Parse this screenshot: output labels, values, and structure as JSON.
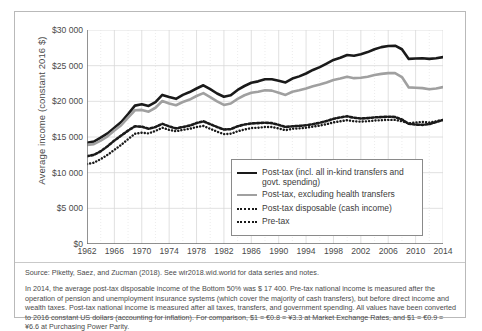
{
  "chart_data": {
    "type": "line",
    "title": "",
    "xlabel": "",
    "ylabel": "Average income (constant 2016 $)",
    "xlim": [
      1962,
      2014
    ],
    "ylim": [
      0,
      30000
    ],
    "grid": true,
    "legend_position": "inside-bottom-right",
    "ytick_labels": [
      "$30 000",
      "$25 000",
      "$20 000",
      "$15 000",
      "$10 000",
      "$5 000",
      "$0"
    ],
    "ytick_values": [
      30000,
      25000,
      20000,
      15000,
      10000,
      5000,
      0
    ],
    "xtick_labels": [
      "1962",
      "1966",
      "1970",
      "1974",
      "1978",
      "1982",
      "1986",
      "1990",
      "1994",
      "1998",
      "2002",
      "2006",
      "2010",
      "2014"
    ],
    "xtick_values": [
      1962,
      1966,
      1970,
      1974,
      1978,
      1982,
      1986,
      1990,
      1994,
      1998,
      2002,
      2006,
      2010,
      2014
    ],
    "x": [
      1962,
      1963,
      1964,
      1965,
      1966,
      1967,
      1968,
      1969,
      1970,
      1971,
      1972,
      1973,
      1974,
      1975,
      1976,
      1977,
      1978,
      1979,
      1980,
      1981,
      1982,
      1983,
      1984,
      1985,
      1986,
      1987,
      1988,
      1989,
      1990,
      1991,
      1992,
      1993,
      1994,
      1995,
      1996,
      1997,
      1998,
      1999,
      2000,
      2001,
      2002,
      2003,
      2004,
      2005,
      2006,
      2007,
      2008,
      2009,
      2010,
      2011,
      2012,
      2013,
      2014
    ],
    "series": [
      {
        "name": "Post-tax (incl. all in-kind transfers and govt. spending)",
        "color": "#1a1a1a",
        "style": "solid",
        "width": 2.6,
        "values": [
          14200,
          14350,
          14900,
          15500,
          16300,
          17100,
          18200,
          19400,
          19600,
          19350,
          19900,
          20900,
          20600,
          20350,
          20900,
          21300,
          21800,
          22250,
          21700,
          21100,
          20650,
          20850,
          21600,
          22150,
          22600,
          22800,
          23100,
          23100,
          22900,
          22650,
          23200,
          23500,
          23900,
          24400,
          24800,
          25300,
          25800,
          26100,
          26500,
          26400,
          26600,
          26900,
          27300,
          27600,
          27750,
          27800,
          27300,
          25950,
          26000,
          26050,
          25950,
          26050,
          26200
        ]
      },
      {
        "name": "Post-tax, excluding health transfers",
        "color": "#a0a0a0",
        "style": "solid",
        "width": 2.6,
        "values": [
          13900,
          14000,
          14500,
          15100,
          15900,
          16650,
          17700,
          18750,
          18800,
          18550,
          19100,
          20050,
          19700,
          19450,
          19900,
          20250,
          20750,
          21150,
          20600,
          20000,
          19500,
          19700,
          20350,
          20850,
          21200,
          21350,
          21550,
          21500,
          21200,
          20900,
          21350,
          21550,
          21800,
          22100,
          22350,
          22650,
          23000,
          23200,
          23450,
          23250,
          23300,
          23450,
          23700,
          23850,
          23950,
          23950,
          23400,
          21950,
          21900,
          21850,
          21700,
          21800,
          22000
        ]
      },
      {
        "name": "Post-tax disposable (cash income)",
        "color": "#1a1a1a",
        "style": "dotted",
        "width": 2.4,
        "values": [
          11200,
          11400,
          11900,
          12500,
          13200,
          13900,
          14700,
          15450,
          15600,
          15500,
          15850,
          16300,
          16000,
          15800,
          16000,
          16150,
          16400,
          16550,
          16150,
          15750,
          15400,
          15450,
          15800,
          16050,
          16250,
          16300,
          16400,
          16400,
          16200,
          15950,
          16150,
          16200,
          16300,
          16450,
          16600,
          16800,
          17050,
          17200,
          17350,
          17200,
          17150,
          17200,
          17300,
          17350,
          17400,
          17400,
          17200,
          16900,
          17050,
          17100,
          17050,
          17200,
          17400
        ]
      },
      {
        "name": "Pre-tax",
        "color": "#1a1a1a",
        "style": "dashed",
        "width": 2.6,
        "values": [
          12300,
          12500,
          13000,
          13700,
          14500,
          15200,
          15900,
          16500,
          16450,
          16150,
          16400,
          16850,
          16500,
          16200,
          16400,
          16600,
          16950,
          17200,
          16800,
          16400,
          16050,
          16100,
          16500,
          16750,
          16900,
          16950,
          17000,
          16950,
          16700,
          16400,
          16500,
          16550,
          16650,
          16800,
          17000,
          17250,
          17550,
          17750,
          17900,
          17700,
          17600,
          17650,
          17750,
          17800,
          17850,
          17800,
          17450,
          16850,
          16750,
          16700,
          16800,
          17100,
          17400
        ]
      }
    ]
  },
  "legend": {
    "items": [
      {
        "label": "Post-tax (incl. all in-kind transfers and govt. spending)",
        "swatch": "solid-black"
      },
      {
        "label": "Post-tax, excluding health transfers",
        "swatch": "solid-gray"
      },
      {
        "label": "Post-tax disposable (cash income)",
        "swatch": "dotted"
      },
      {
        "label": "Pre-tax",
        "swatch": "dashed"
      }
    ]
  },
  "notes": {
    "source": "Source: Piketty, Saez, and Zucman (2018). See wir2018.wid.world for data series and notes.",
    "body": "In 2014, the average post-tax disposable income of the Bottom 50% was $ 17 400. Pre-tax national income is measured after the operation of pension and unemployment insurance systems (which cover the majority of cash transfers), but before direct income and wealth taxes. Post-tax national income is measured after all taxes, transfers, and government spending. All values have been converted to 2016 constant US dollars (accounting for inflation). For comparison, $1 = €0.8 = ¥3.3 at Market Exchange Rates, and $1 = €0.9 = ¥6.6 at Purchasing Power Parity."
  },
  "colors": {
    "series_black": "#1a1a1a",
    "series_gray": "#a0a0a0",
    "grid": "#d8d8d8",
    "axis": "#6b6b6b",
    "text": "#4a4a4a",
    "frame": "#b9b9b9"
  }
}
